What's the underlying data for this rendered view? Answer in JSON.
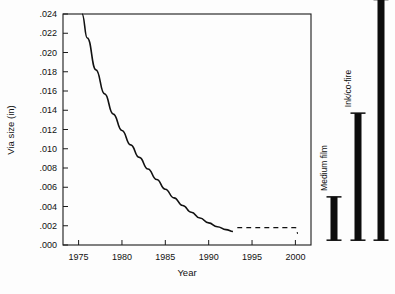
{
  "chart_data": {
    "type": "line",
    "title": "",
    "xlabel": "Year",
    "ylabel": "Via size (in)",
    "xlim": [
      1973.2,
      2001.8
    ],
    "ylim": [
      0.0,
      0.024
    ],
    "grid": false,
    "legend_position": "none",
    "xticks": [
      1975,
      1980,
      1985,
      1990,
      1995,
      2000
    ],
    "xtick_labels": [
      "1975",
      "1980",
      "1985",
      "1990",
      "1995",
      "2000"
    ],
    "yticks": [
      0.0,
      0.002,
      0.004,
      0.006,
      0.008,
      0.01,
      0.012,
      0.014,
      0.016,
      0.018,
      0.02,
      0.022,
      0.024
    ],
    "ytick_labels": [
      ".000",
      ".002",
      ".004",
      ".006",
      ".008",
      ".010",
      ".012",
      ".014",
      ".016",
      ".018",
      ".020",
      ".022",
      ".024"
    ],
    "series": [
      {
        "name": "Via size trend",
        "style": "solid",
        "x": [
          1975.4,
          1976,
          1977,
          1978,
          1979,
          1980,
          1981,
          1982,
          1983,
          1984,
          1985,
          1986,
          1987,
          1988,
          1989,
          1990,
          1991,
          1992,
          1992.8
        ],
        "values": [
          0.024,
          0.0215,
          0.0182,
          0.0157,
          0.0136,
          0.0119,
          0.0104,
          0.0091,
          0.0079,
          0.0068,
          0.0058,
          0.0049,
          0.0041,
          0.0034,
          0.0028,
          0.0023,
          0.0019,
          0.0016,
          0.0014
        ]
      },
      {
        "name": "Projected via size",
        "style": "dashed",
        "x": [
          1993.3,
          1994,
          1995,
          1996,
          1997,
          1998,
          1999,
          2000,
          2000.3
        ],
        "values": [
          0.0018,
          0.0018,
          0.0018,
          0.0018,
          0.0018,
          0.0018,
          0.0018,
          0.0018,
          0.0012
        ]
      }
    ],
    "range_bars": [
      {
        "label": "Medium film",
        "low": 0.0005,
        "high": 0.005,
        "label_position": "above"
      },
      {
        "label": "Ink/co-fire",
        "low": 0.0005,
        "high": 0.0137,
        "label_position": "above"
      },
      {
        "label": "Print/etch",
        "low": 0.0005,
        "high": 0.0255,
        "label_position": "above"
      }
    ]
  },
  "colors": {
    "background": "#fdfdfd",
    "axis": "#1a1a1a",
    "curve": "#111111",
    "bar": "#0d0d0d"
  }
}
